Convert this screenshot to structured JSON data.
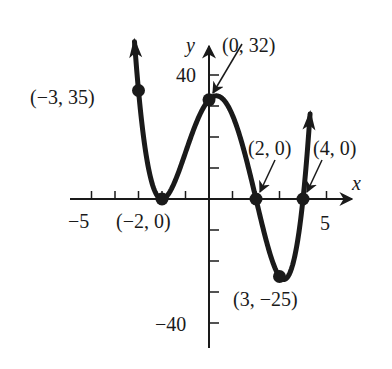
{
  "chart_data": {
    "type": "line",
    "title": "",
    "function": "f(x) = (x + 2)^2 (x - 2)(x - 4)",
    "xlabel": "x",
    "ylabel": "y",
    "xlim": [
      -5.5,
      5.5
    ],
    "ylim": [
      -45,
      45
    ],
    "x_tick_step": 1,
    "y_tick_step": 10,
    "x_tick_labels": [
      "-5",
      "5"
    ],
    "y_tick_labels": [
      "40",
      "-40"
    ],
    "grid": false,
    "key_points": [
      {
        "x": -3,
        "y": 35,
        "label": "(−3, 35)"
      },
      {
        "x": -2,
        "y": 0,
        "label": "(−2, 0)"
      },
      {
        "x": 0,
        "y": 32,
        "label": "(0, 32)"
      },
      {
        "x": 2,
        "y": 0,
        "label": "(2, 0)"
      },
      {
        "x": 3,
        "y": -25,
        "label": "(3, −25)"
      },
      {
        "x": 4,
        "y": 0,
        "label": "(4, 0)"
      }
    ],
    "series": [
      {
        "name": "f(x)",
        "x": [
          -3.15,
          -3,
          -2.5,
          -2,
          -1.5,
          -1,
          -0.5,
          0,
          0.5,
          1,
          1.5,
          2,
          2.5,
          3,
          3.5,
          4,
          4.3
        ],
        "values": [
          41.0,
          35,
          11.8,
          0,
          4.4,
          15,
          26.6,
          32,
          28.1,
          27,
          12.3,
          0,
          -12.4,
          -25,
          -14.1,
          0,
          17.0
        ]
      }
    ]
  },
  "labels": {
    "x_axis": "x",
    "y_axis": "y",
    "tick_neg5": "−5",
    "tick_5": "5",
    "tick_40": "40",
    "tick_neg40": "−40",
    "pt_m3_35": "(−3, 35)",
    "pt_m2_0": "(−2, 0)",
    "pt_0_32": "(0, 32)",
    "pt_2_0": "(2, 0)",
    "pt_4_0": "(4, 0)",
    "pt_3_m25": "(3, −25)"
  },
  "colors": {
    "ink": "#1a1a1a",
    "background": "#ffffff"
  }
}
